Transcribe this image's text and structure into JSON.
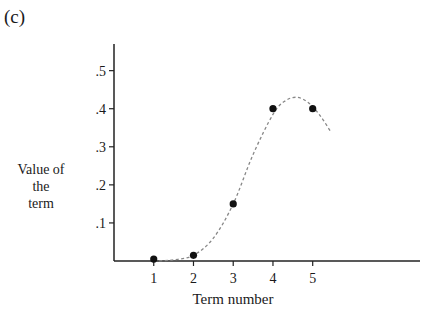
{
  "panel_label": "(c)",
  "chart_data": {
    "type": "scatter",
    "title": "",
    "xlabel": "Term number",
    "ylabel_lines": [
      "Value of",
      "the",
      "term"
    ],
    "x": [
      1,
      2,
      3,
      4,
      5
    ],
    "y": [
      0.005,
      0.015,
      0.15,
      0.4,
      0.4
    ],
    "xticks": [
      1,
      2,
      3,
      4,
      5
    ],
    "xtick_labels": [
      "1",
      "2",
      "3",
      "4",
      "5"
    ],
    "yticks": [
      0.1,
      0.2,
      0.3,
      0.4,
      0.5
    ],
    "ytick_labels": [
      ".1",
      ".2",
      ".3",
      ".4",
      ".5"
    ],
    "xlim": [
      0,
      7.7
    ],
    "ylim": [
      0,
      0.57
    ],
    "grid": false,
    "legend": "none",
    "fit_curve": {
      "style": "dashed",
      "x": [
        1,
        1.5,
        2,
        2.5,
        3,
        3.5,
        4,
        4.3,
        4.6,
        4.9,
        5.2,
        5.45
      ],
      "y": [
        0.0,
        0.003,
        0.015,
        0.06,
        0.15,
        0.28,
        0.385,
        0.42,
        0.43,
        0.415,
        0.38,
        0.34
      ]
    }
  }
}
